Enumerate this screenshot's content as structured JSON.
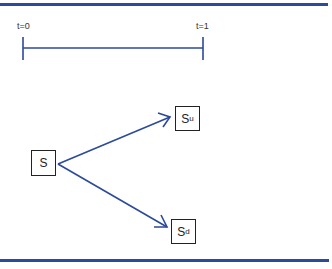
{
  "timeline": {
    "start_label": "t=0",
    "end_label": "t=1"
  },
  "nodes": {
    "root": {
      "label": "S",
      "sub": ""
    },
    "up": {
      "label": "S",
      "sub": "u"
    },
    "down": {
      "label": "S",
      "sub": "d"
    }
  },
  "colors": {
    "rule": "#2c4a9a",
    "arrow": "#2c4a9a",
    "box_border": "#222222"
  }
}
